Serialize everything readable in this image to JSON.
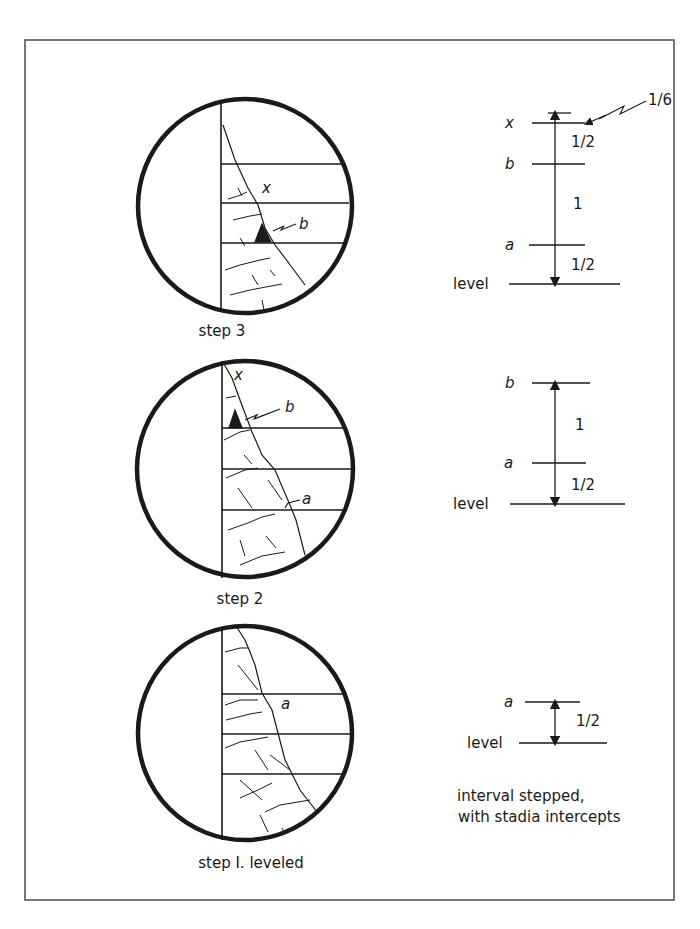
{
  "figure": {
    "frame_color": "#555555",
    "ink_color": "#1a1a1a",
    "panels": [
      {
        "id": "step3",
        "caption": "step 3",
        "scope_labels": {
          "x": "x",
          "b": "b"
        },
        "scale": {
          "marks": [
            {
              "label": "x",
              "tick": "x"
            },
            {
              "label": "b",
              "tick": "b"
            },
            {
              "label": "a",
              "tick": "a"
            },
            {
              "label": "level",
              "tick": "level"
            }
          ],
          "intervals": [
            "1/2",
            "1",
            "1/2"
          ],
          "callout": "1/6"
        }
      },
      {
        "id": "step2",
        "caption": "step 2",
        "scope_labels": {
          "x": "x",
          "b": "b",
          "a": "a"
        },
        "scale": {
          "marks": [
            {
              "label": "b",
              "tick": "b"
            },
            {
              "label": "a",
              "tick": "a"
            },
            {
              "label": "level",
              "tick": "level"
            }
          ],
          "intervals": [
            "1",
            "1/2"
          ]
        }
      },
      {
        "id": "step1",
        "caption": "step I. leveled",
        "scope_labels": {
          "a": "a"
        },
        "scale": {
          "marks": [
            {
              "label": "a",
              "tick": "a"
            },
            {
              "label": "level",
              "tick": "level"
            }
          ],
          "intervals": [
            "1/2"
          ]
        }
      }
    ],
    "note_line1": "interval stepped,",
    "note_line2": "with stadia intercepts"
  }
}
